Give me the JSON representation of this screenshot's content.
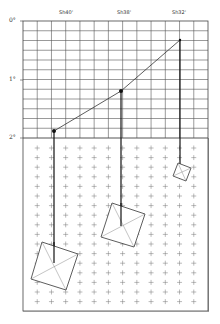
{
  "diagram": {
    "type": "pendulum-sun-position",
    "y_axis": {
      "labels": [
        "0°",
        "1°",
        "2°"
      ]
    },
    "times": [
      {
        "label": "Sh40'"
      },
      {
        "label": "Sh38'"
      },
      {
        "label": "Sh32'"
      }
    ],
    "colors": {
      "grid": "#555555",
      "cross": "#888888",
      "line": "#222222",
      "background": "#ffffff"
    }
  }
}
